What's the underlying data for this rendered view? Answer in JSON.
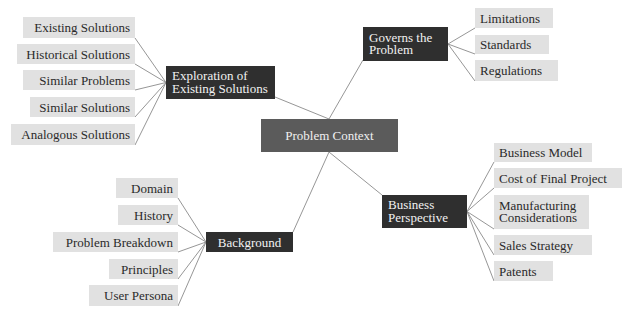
{
  "diagram": {
    "type": "mind-map",
    "colors": {
      "center_fill": "#5b5b5b",
      "branch_fill": "#2f2f2f",
      "leaf_fill": "#e1e1e1",
      "edge": "#8a8a8a"
    },
    "center": {
      "label": "Problem Context"
    },
    "branches": [
      {
        "id": "exploration",
        "label": "Exploration of\nExisting Solutions",
        "leaves": [
          "Existing Solutions",
          "Historical Solutions",
          "Similar Problems",
          "Similar Solutions",
          "Analogous Solutions"
        ]
      },
      {
        "id": "governs",
        "label": "Governs the\nProblem",
        "leaves": [
          "Limitations",
          "Standards",
          "Regulations"
        ]
      },
      {
        "id": "background",
        "label": "Background",
        "leaves": [
          "Domain",
          "History",
          "Problem Breakdown",
          "Principles",
          "User Persona"
        ]
      },
      {
        "id": "business",
        "label": "Business\nPerspective",
        "leaves": [
          "Business Model",
          "Cost of Final Project",
          "Manufacturing\nConsiderations",
          "Sales Strategy",
          "Patents"
        ]
      }
    ]
  }
}
